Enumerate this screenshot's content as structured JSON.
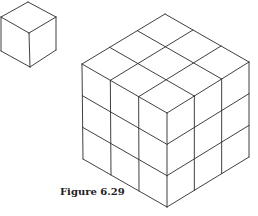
{
  "figure": {
    "caption": "Figure 6.29",
    "small_cube": {
      "description": "single unit cube, isometric view",
      "vertices": {
        "top": [
          28,
          2
        ],
        "left_top": [
          1,
          17
        ],
        "right_top": [
          56,
          17
        ],
        "center": [
          29,
          33
        ],
        "left_bottom": [
          1,
          51
        ],
        "right_bottom": [
          56,
          50
        ],
        "bottom": [
          30,
          67
        ]
      }
    },
    "large_cube": {
      "description": "3x3x3 cube composed of unit cubes, isometric view",
      "divisions": 3,
      "vertices": {
        "top": [
          165,
          14
        ],
        "left_top": [
          82,
          64
        ],
        "right_top": [
          249,
          62
        ],
        "center": [
          167,
          113
        ],
        "left_bottom": [
          83,
          159
        ],
        "right_bottom": [
          249,
          157
        ],
        "bottom": [
          167,
          207
        ]
      }
    },
    "line_color": "#2a2a2a",
    "background": "#ffffff"
  }
}
